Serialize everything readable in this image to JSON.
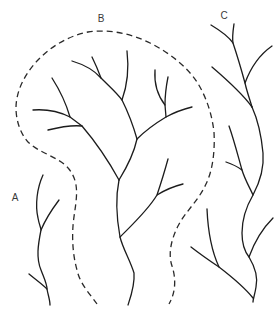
{
  "diagram": {
    "title": "",
    "width": 280,
    "height": 312,
    "colors": {
      "stream": "#1c1c1c",
      "boundary": "#2a2a2a",
      "label": "#3a3a3a",
      "background": "#ffffff"
    },
    "labels": [
      {
        "id": "A",
        "text": "A"
      },
      {
        "id": "B",
        "text": "B"
      },
      {
        "id": "C",
        "text": "C"
      }
    ],
    "networks": [
      {
        "id": "A",
        "paths": [
          {
            "name": "network-a-main-channel",
            "type": "solid",
            "d": "M43,175 C37,188 35,205 38,218 C39,224 41,228 41,230 C38,245 36,258 41,270 C44,278 47,284 47,289 C48,295 50,300 50,305"
          },
          {
            "name": "network-a-upper-tributary",
            "type": "solid",
            "d": "M59,200 C53,208 46,218 41,230"
          },
          {
            "name": "network-a-lower-tributary",
            "type": "solid",
            "d": "M29,274 C35,279 42,284 47,289"
          }
        ]
      },
      {
        "id": "B",
        "paths": [
          {
            "name": "network-b-upper-limb",
            "type": "solid",
            "d": "M72,61 C82,64 94,70 101,78 C109,86 117,93 122,100 C128,112 133,125 137,139"
          },
          {
            "name": "network-b-tributary-1",
            "type": "solid",
            "d": "M92,57 C95,63 98,70 101,78"
          },
          {
            "name": "network-b-tributary-2",
            "type": "solid",
            "d": "M127,51 C129,68 127,86 122,100"
          },
          {
            "name": "network-b-right-limb",
            "type": "solid",
            "d": "M137,139 C145,131 156,123 166,117 C175,112 184,109 192,107"
          },
          {
            "name": "network-b-tributary-3",
            "type": "solid",
            "d": "M155,70 C154,84 158,96 165,105 L166,117"
          },
          {
            "name": "network-b-tributary-4",
            "type": "solid",
            "d": "M168,77 C166,87 165,96 165,105"
          },
          {
            "name": "network-b-trunk-middle",
            "type": "solid",
            "d": "M137,139 C134,153 127,167 119,180"
          },
          {
            "name": "network-b-left-limb",
            "type": "solid",
            "d": "M33,110 C46,109 60,112 70,117 C74,120 78,123 82,126 C94,140 108,160 119,180"
          },
          {
            "name": "network-b-tributary-5",
            "type": "solid",
            "d": "M52,78 C59,89 66,103 70,117"
          },
          {
            "name": "network-b-tributary-6",
            "type": "solid",
            "d": "M48,130 C60,127 72,125 82,126"
          },
          {
            "name": "network-b-trunk-lower",
            "type": "solid",
            "d": "M119,180 C116,195 116,215 120,237 C123,249 130,260 134,273 C135,285 131,296 128,305"
          },
          {
            "name": "network-b-lower-right-limb",
            "type": "solid",
            "d": "M120,237 C133,224 148,210 157,195 C161,183 165,170 168,159"
          },
          {
            "name": "network-b-tributary-7",
            "type": "solid",
            "d": "M157,195 C165,190 175,186 183,184"
          }
        ]
      },
      {
        "id": "C",
        "paths": [
          {
            "name": "network-c-top-limb",
            "type": "solid",
            "d": "M211,25 C221,31 229,37 233,43 C238,58 242,72 245,83 C247,92 250,100 252,107"
          },
          {
            "name": "network-c-tributary-1",
            "type": "solid",
            "d": "M234,24 C233,31 232,37 233,43"
          },
          {
            "name": "network-c-tributary-2",
            "type": "solid",
            "d": "M272,46 C262,53 252,64 245,83"
          },
          {
            "name": "network-c-left-upper-limb",
            "type": "solid",
            "d": "M212,67 C226,79 242,93 252,107"
          },
          {
            "name": "network-c-main-channel",
            "type": "solid",
            "d": "M252,107 C257,118 261,132 263,153 C264,165 261,180 253,195 C246,207 242,220 242,233 C242,245 245,252 249,257 C255,267 258,278 256,287 C255,294 253,299 253,302"
          },
          {
            "name": "network-c-inner-channel",
            "type": "solid",
            "d": "M229,126 C234,140 238,156 242,170 C245,180 250,188 253,195"
          },
          {
            "name": "network-c-tributary-3",
            "type": "solid",
            "d": "M226,162 C232,164 238,167 242,170"
          },
          {
            "name": "network-c-tributary-4",
            "type": "solid",
            "d": "M273,218 C263,228 254,243 249,257"
          },
          {
            "name": "network-c-lower-left-limb",
            "type": "solid",
            "d": "M191,247 C200,254 210,261 219,267 C232,277 245,288 253,298"
          },
          {
            "name": "network-c-tributary-5",
            "type": "solid",
            "d": "M207,209 C208,232 212,252 219,267"
          }
        ]
      }
    ],
    "boundaries": [
      {
        "name": "network-b-watershed-boundary",
        "type": "dashed",
        "d": "M97,304 C90,294 80,284 77,270 C73,256 72,240 73,226 C74,212 78,198 76,185 C74,173 67,165 58,160 C48,154 36,150 28,142 C20,133 16,120 16,108 C16,92 24,75 37,61 C50,47 68,36 88,32 C108,29 130,33 150,43 C170,53 187,67 197,82 C207,98 212,115 214,132 C215,150 213,170 206,184 C199,200 185,212 178,226 C171,240 168,254 172,266 C176,278 176,292 169,304"
      }
    ]
  }
}
